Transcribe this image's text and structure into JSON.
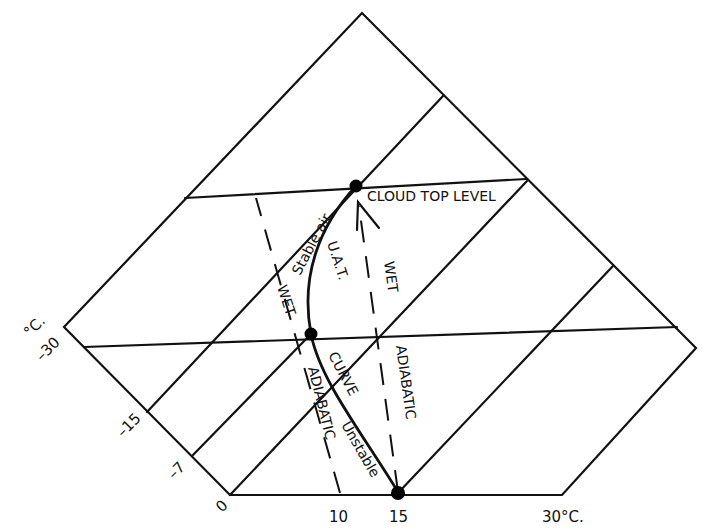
{
  "diagram": {
    "type": "tephigram",
    "colors": {
      "line": "#111111",
      "background": "#ffffff"
    },
    "axis_left": {
      "unit_label": "°C.",
      "ticks": [
        "–30",
        "–15",
        "–7",
        "0"
      ]
    },
    "axis_bottom": {
      "ticks": [
        "10",
        "15",
        "30°C."
      ]
    },
    "points": {
      "cloud_top": "CLOUD TOP LEVEL",
      "mid": "",
      "base": ""
    },
    "labels": {
      "stable_air": "Stable air",
      "uat": "U.A.T.",
      "curve": "CURVE",
      "unstable": "Unstable",
      "wet_left": "WET",
      "adiabatic_left": "ADIABATIC",
      "wet_right": "WET",
      "adiabatic_right": "ADIABATIC"
    }
  }
}
